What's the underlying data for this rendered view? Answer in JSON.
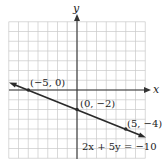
{
  "chart_data": {
    "type": "line",
    "title": "",
    "xlabel": "x",
    "ylabel": "y",
    "xlim": [
      -7,
      7
    ],
    "ylim": [
      -7,
      7
    ],
    "grid": true,
    "grid_step": 1,
    "series": [
      {
        "name": "2x + 5y = −10",
        "equation": "2x + 5y = −10",
        "slope": -0.4,
        "intercept": -2,
        "x": [
          -7.5,
          7
        ],
        "y": [
          1.0,
          -4.8
        ],
        "arrows": "both"
      }
    ],
    "points": [
      {
        "x": -5,
        "y": 0,
        "label": "(−5, 0)"
      },
      {
        "x": 0,
        "y": -2,
        "label": "(0, −2)"
      },
      {
        "x": 5,
        "y": -4,
        "label": "(5, −4)"
      }
    ],
    "annotations": [
      {
        "text": "2x + 5y = −10",
        "x": 1.5,
        "y": -5.5
      }
    ]
  },
  "labels": {
    "x_axis": "x",
    "y_axis": "y",
    "equation": "2x + 5y = −10",
    "p1": "(−5, 0)",
    "p2": "(0, −2)",
    "p3": "(5, −4)"
  },
  "colors": {
    "grid": "#c8c8c8",
    "axis": "#333333",
    "line": "#2a2a2a"
  }
}
